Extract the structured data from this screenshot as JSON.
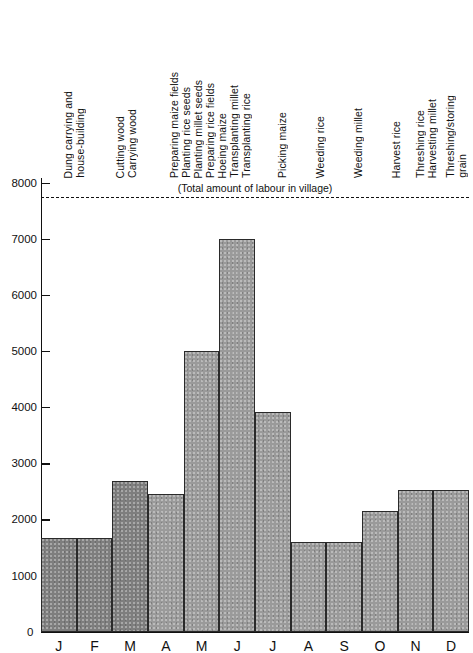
{
  "chart_data": {
    "type": "bar",
    "title": "",
    "xlabel": "",
    "ylabel": "Man-days of labour",
    "categories": [
      "J",
      "F",
      "M",
      "A",
      "M",
      "J",
      "J",
      "A",
      "S",
      "O",
      "N",
      "D"
    ],
    "values": [
      1670,
      1670,
      2690,
      2450,
      5000,
      7000,
      3910,
      1600,
      1600,
      2150,
      2520,
      2520
    ],
    "ylim": [
      0,
      8000
    ],
    "y_ticks": [
      0,
      1000,
      2000,
      3000,
      4000,
      5000,
      6000,
      7000,
      8000
    ],
    "y_tick_labels": [
      "0",
      "1000",
      "2000",
      "3000",
      "4000",
      "5000",
      "6000",
      "7000",
      "8000"
    ],
    "grid": false,
    "legend": "none",
    "reference_line": {
      "label": "(Total amount of labour in village)",
      "value": 7750,
      "style": "dashed"
    },
    "annotations": [
      {
        "months": [
          "J",
          "F"
        ],
        "lines": [
          "Dung carrying and",
          "house-building"
        ]
      },
      {
        "months": [
          "M"
        ],
        "lines": [
          "Cutting wood",
          "Carrying wood"
        ]
      },
      {
        "months": [
          "A",
          "M"
        ],
        "lines": [
          "Preparing maize fields",
          "Planting rice seeds",
          "Planting millet seeds",
          "Preparing rice fields",
          "Hoeing maize"
        ]
      },
      {
        "months": [
          "J"
        ],
        "lines": [
          "Transplanting millet",
          "Transplanting rice"
        ]
      },
      {
        "months": [
          "J"
        ],
        "lines": [
          "Picking maize"
        ]
      },
      {
        "months": [
          "A"
        ],
        "lines": [
          "Weeding rice"
        ]
      },
      {
        "months": [
          "S"
        ],
        "lines": [
          "Weeding millet"
        ]
      },
      {
        "months": [
          "O"
        ],
        "lines": [
          "Harvest rice"
        ]
      },
      {
        "months": [
          "N"
        ],
        "lines": [
          "Threshing rice",
          "Harvesting millet"
        ]
      },
      {
        "months": [
          "D"
        ],
        "lines": [
          "Threshing/storing",
          "grain"
        ]
      }
    ]
  },
  "axis": {
    "y_title": "Man-days of labour",
    "zero_label": "0"
  },
  "colors": {
    "bar_fill": "#9a9a9a",
    "bar_fill_dark": "#7e7e7e",
    "bar_stroke": "#2a2a2a",
    "axis": "#111111",
    "text": "#111111"
  }
}
